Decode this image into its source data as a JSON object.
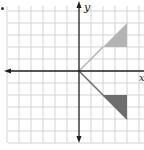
{
  "figure": {
    "type": "coordinate-plane",
    "axes": {
      "x_label": "x",
      "y_label": "y",
      "origin_px": [
        79,
        71
      ],
      "grid_spacing_px": 12
    },
    "grid": {
      "x_range_units": [
        -6,
        5
      ],
      "y_range_units": [
        -6,
        5
      ],
      "color": "#c8c8c8"
    },
    "shapes": [
      {
        "name": "upper-triangle",
        "fill": "#b4b4b4",
        "vertices_units": [
          [
            2,
            2
          ],
          [
            4,
            2
          ],
          [
            4,
            4
          ]
        ]
      },
      {
        "name": "lower-triangle",
        "fill": "#6e6e6e",
        "vertices_units": [
          [
            2,
            -2
          ],
          [
            4,
            -2
          ],
          [
            4,
            -4
          ]
        ]
      }
    ],
    "rays": [
      {
        "name": "upper-ray",
        "from": [
          0,
          0
        ],
        "to": [
          2,
          2
        ],
        "color": "#b4b4b4"
      },
      {
        "name": "lower-ray",
        "from": [
          0,
          0
        ],
        "to": [
          4,
          -4
        ],
        "color": "#6e6e6e"
      }
    ],
    "colors": {
      "axis": "#1e1e1e",
      "grid": "#c8c8c8"
    }
  }
}
